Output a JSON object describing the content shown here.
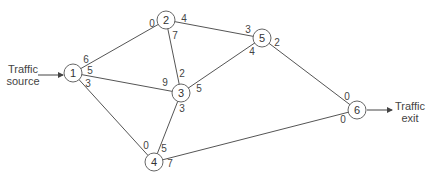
{
  "diagram": {
    "type": "network-flow",
    "source_label": [
      "Traffic",
      "source"
    ],
    "exit_label": [
      "Traffic",
      "exit"
    ],
    "nodes": [
      {
        "id": "1",
        "x": 73,
        "y": 73
      },
      {
        "id": "2",
        "x": 166,
        "y": 20
      },
      {
        "id": "3",
        "x": 181,
        "y": 93
      },
      {
        "id": "4",
        "x": 154,
        "y": 162
      },
      {
        "id": "5",
        "x": 262,
        "y": 38
      },
      {
        "id": "6",
        "x": 357,
        "y": 110
      }
    ],
    "edges": [
      {
        "from": "1",
        "to": "2",
        "cap_from": "6",
        "cap_to": "0"
      },
      {
        "from": "1",
        "to": "3",
        "cap_from": "5",
        "cap_to": "9"
      },
      {
        "from": "1",
        "to": "4",
        "cap_from": "3",
        "cap_to": "0"
      },
      {
        "from": "2",
        "to": "3",
        "cap_from": "7",
        "cap_to": "2"
      },
      {
        "from": "2",
        "to": "5",
        "cap_from": "4",
        "cap_to": "3"
      },
      {
        "from": "3",
        "to": "5",
        "cap_from": "5",
        "cap_to": "4"
      },
      {
        "from": "3",
        "to": "4",
        "cap_from": "3",
        "cap_to": "5"
      },
      {
        "from": "5",
        "to": "6",
        "cap_from": "2",
        "cap_to": "0"
      },
      {
        "from": "4",
        "to": "6",
        "cap_from": "7",
        "cap_to": "0"
      }
    ],
    "capacity_labels": [
      {
        "text": "6",
        "x": 86,
        "y": 60
      },
      {
        "text": "0",
        "x": 152,
        "y": 24
      },
      {
        "text": "5",
        "x": 90,
        "y": 71
      },
      {
        "text": "9",
        "x": 165,
        "y": 83
      },
      {
        "text": "3",
        "x": 88,
        "y": 84
      },
      {
        "text": "0",
        "x": 146,
        "y": 146
      },
      {
        "text": "7",
        "x": 175,
        "y": 36
      },
      {
        "text": "2",
        "x": 182,
        "y": 74
      },
      {
        "text": "4",
        "x": 184,
        "y": 19
      },
      {
        "text": "3",
        "x": 248,
        "y": 30
      },
      {
        "text": "5",
        "x": 199,
        "y": 89
      },
      {
        "text": "4",
        "x": 252,
        "y": 52
      },
      {
        "text": "3",
        "x": 182,
        "y": 109
      },
      {
        "text": "5",
        "x": 164,
        "y": 149
      },
      {
        "text": "2",
        "x": 277,
        "y": 43
      },
      {
        "text": "0",
        "x": 347,
        "y": 97
      },
      {
        "text": "7",
        "x": 170,
        "y": 164
      },
      {
        "text": "0",
        "x": 343,
        "y": 120
      }
    ],
    "node_radius": 9,
    "line_color": "#555555",
    "node_stroke": "#666666"
  }
}
